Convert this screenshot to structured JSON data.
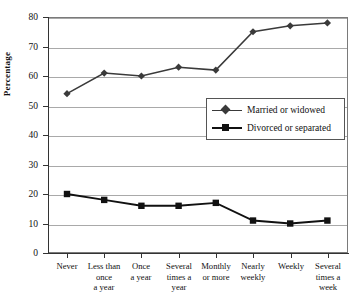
{
  "chart_data": {
    "type": "line",
    "title": "",
    "subtitle": "",
    "xlabel": "",
    "ylabel": "Percentage",
    "ylim": [
      0,
      80
    ],
    "ytick_step": 10,
    "yticks": [
      0,
      10,
      20,
      30,
      40,
      50,
      60,
      70,
      80
    ],
    "grid": true,
    "legend_position": "center-right",
    "categories": [
      "Never",
      "Less than once a year",
      "Once a year",
      "Several times a year",
      "Monthly or more",
      "Nearly weekly",
      "Weekly",
      "Several times a week"
    ],
    "category_lines": [
      [
        "Never"
      ],
      [
        "Less than",
        "once",
        "a year"
      ],
      [
        "Once",
        "a year"
      ],
      [
        "Several",
        "times a",
        "year"
      ],
      [
        "Monthly",
        "or more"
      ],
      [
        "Nearly",
        "weekly"
      ],
      [
        "Weekly"
      ],
      [
        "Several",
        "times a",
        "week"
      ]
    ],
    "series": [
      {
        "name": "Married or widowed",
        "marker": "diamond",
        "color": "#3a3a3a",
        "values": [
          54,
          61,
          60,
          63,
          62,
          75,
          77,
          78
        ]
      },
      {
        "name": "Divorced or separated",
        "marker": "square",
        "color": "#111111",
        "values": [
          20,
          18,
          16,
          16,
          17,
          11,
          10,
          11
        ]
      }
    ]
  },
  "legend": {
    "items": [
      {
        "label": "Married or widowed",
        "marker": "diamond"
      },
      {
        "label": "Divorced or separated",
        "marker": "square"
      }
    ]
  },
  "axis": {
    "y_title": "Percentage",
    "y_tick_labels": [
      "0",
      "10",
      "20",
      "30",
      "40",
      "50",
      "60",
      "70",
      "80"
    ]
  },
  "colors": {
    "series_married": "#3a3a3a",
    "series_divorced": "#111111",
    "gridline": "#a9a9a9",
    "frame": "#7a7a7a",
    "axis": "#333333",
    "background": "#ffffff"
  }
}
